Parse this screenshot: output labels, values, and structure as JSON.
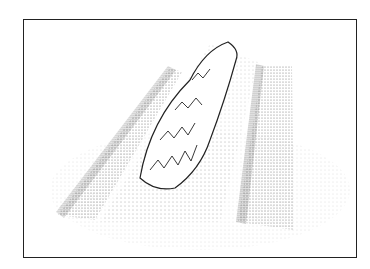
{
  "illustration": {
    "subject": "stippled drawing of raised garden beds with a central hedge",
    "colors": {
      "ink": "#222222",
      "paper": "#ffffff",
      "stipple": "#555555"
    }
  }
}
